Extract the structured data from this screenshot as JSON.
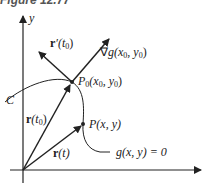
{
  "figure": {
    "title": "Figure 12.77"
  },
  "axes": {
    "y_label": "y"
  },
  "labels": {
    "curve": "C",
    "r_prime_t0_bold": "r",
    "r_prime_t0_rest": "′(t",
    "r_prime_t0_sub": "0",
    "r_prime_t0_close": ")",
    "grad_prefix": "∇",
    "grad_g": "g",
    "grad_args": "(x",
    "grad_sub1": "0",
    "grad_mid": ", y",
    "grad_sub2": "0",
    "grad_close": ")",
    "p0_name": "P",
    "p0_sub": "0",
    "p0_args": "(x",
    "p0_sub1": "0",
    "p0_mid": ", y",
    "p0_sub2": "0",
    "p0_close": ")",
    "r_t0_bold": "r",
    "r_t0_rest": "(t",
    "r_t0_sub": "0",
    "r_t0_close": ")",
    "p_point": "P(x, y)",
    "r_t_bold": "r",
    "r_t_rest": "(t)",
    "level_curve": "g(x, y) = 0"
  },
  "colors": {
    "ink": "#222222",
    "background": "#ffffff"
  }
}
